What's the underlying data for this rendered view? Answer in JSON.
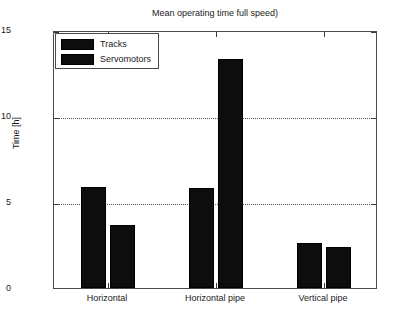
{
  "chart_data": {
    "type": "bar",
    "title": "Mean operating time full speed)",
    "xlabel": "",
    "ylabel": "Time [h]",
    "categories": [
      "Horizontal",
      "Horizontal pipe",
      "Vertical pipe"
    ],
    "series": [
      {
        "name": "Tracks",
        "values": [
          5.9,
          5.8,
          2.6
        ],
        "color": "#0d0d0d"
      },
      {
        "name": "Servomotors",
        "values": [
          3.65,
          13.3,
          2.4
        ],
        "color": "#0d0d0d"
      }
    ],
    "ylim": [
      0,
      15
    ],
    "y_ticks": [
      0,
      5,
      10,
      15
    ],
    "y_tick_labels": [
      "0",
      "5",
      "10",
      "15"
    ],
    "grid": "horizontal-dotted",
    "legend_position": "top-left",
    "legend_entries": [
      "Tracks",
      "Servomotors"
    ]
  },
  "figure": {
    "background": "#ffffff",
    "axes_color": "#4a4a4a",
    "grid_color": "#555555"
  }
}
